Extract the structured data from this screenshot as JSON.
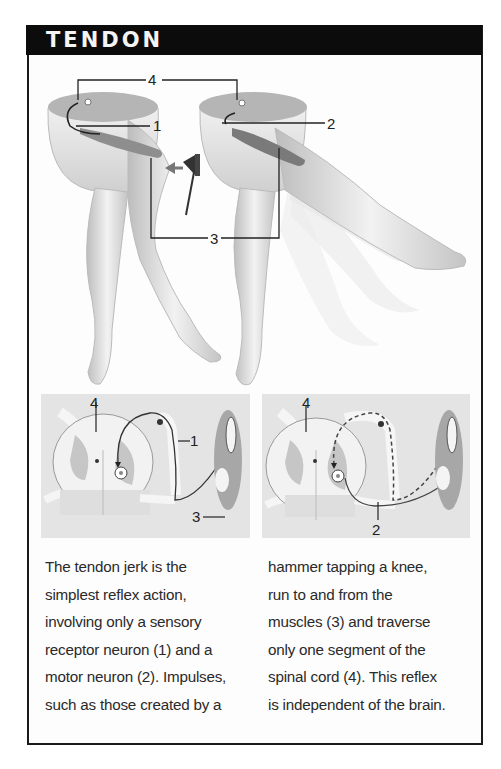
{
  "header": {
    "title": "TENDON"
  },
  "figure": {
    "top_labels": {
      "spinal_cord": "4",
      "sensory_neuron": "1",
      "motor_neuron": "2",
      "muscles": "3"
    },
    "left_panel_labels": {
      "spinal_cord": "4",
      "sensory_neuron": "1",
      "muscles": "3"
    },
    "right_panel_labels": {
      "spinal_cord": "4",
      "motor_neuron": "2"
    },
    "colors": {
      "header_bg": "#0c0c0c",
      "panel_bg": "#e4e4e4",
      "leg_shade": "#d2d2d2",
      "line": "#222222"
    }
  },
  "caption": {
    "left_lines": [
      "The tendon jerk is the",
      "simplest reflex action,",
      "involving only a sensory",
      "receptor neuron (1) and a",
      "motor neuron (2). Impulses,",
      "such as those created by a"
    ],
    "right_lines": [
      "hammer tapping a knee,",
      "run to and from the",
      "muscles (3) and traverse",
      "only one segment of the",
      "spinal cord (4). This reflex",
      "is independent of the brain."
    ]
  }
}
